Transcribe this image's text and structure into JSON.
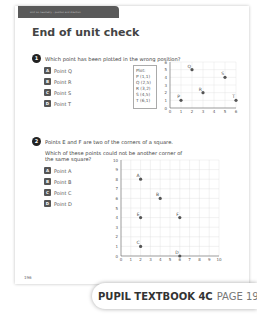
{
  "header": {
    "unit_label": "Unit 14: Geometry – position and direction",
    "title": "End of unit check"
  },
  "question1": {
    "number": "1",
    "text": "Which point has been plotted in the wrong position?",
    "options": [
      {
        "letter": "A",
        "label": "Point Q"
      },
      {
        "letter": "B",
        "label": "Point R"
      },
      {
        "letter": "C",
        "label": "Point S"
      },
      {
        "letter": "D",
        "label": "Point T"
      }
    ],
    "plot_box": {
      "title": "Plot:",
      "entries": [
        "P (1,1)",
        "Q (2,5)",
        "R (3,2)",
        "S (4,5)",
        "T (6,1)"
      ]
    }
  },
  "question2": {
    "number": "2",
    "text_line1": "Points E and F are two of the corners of a square.",
    "text_line2": "Which of these points could not be another corner of",
    "text_line3": "the same square?",
    "options": [
      {
        "letter": "A",
        "label": "Point A"
      },
      {
        "letter": "B",
        "label": "Point B"
      },
      {
        "letter": "C",
        "label": "Point C"
      },
      {
        "letter": "D",
        "label": "Point D"
      }
    ]
  },
  "footer": {
    "page_number": "196",
    "book_label": "PUPIL TEXTBOOK 4C",
    "page_label": "PAGE 196"
  },
  "chart_data": [
    {
      "type": "scatter",
      "title": "",
      "xlabel": "",
      "ylabel": "",
      "xlim": [
        0,
        6
      ],
      "ylim": [
        0,
        6
      ],
      "x_ticks": [
        0,
        1,
        2,
        3,
        4,
        5,
        6
      ],
      "y_ticks": [
        0,
        1,
        2,
        3,
        4,
        5,
        6
      ],
      "grid": true,
      "points": [
        {
          "label": "P",
          "x": 1,
          "y": 1
        },
        {
          "label": "Q",
          "x": 2,
          "y": 5
        },
        {
          "label": "R",
          "x": 3,
          "y": 2
        },
        {
          "label": "S",
          "x": 5,
          "y": 4
        },
        {
          "label": "T",
          "x": 6,
          "y": 1
        }
      ]
    },
    {
      "type": "scatter",
      "title": "",
      "xlabel": "",
      "ylabel": "",
      "xlim": [
        0,
        10
      ],
      "ylim": [
        0,
        10
      ],
      "x_ticks": [
        0,
        1,
        2,
        3,
        4,
        5,
        6,
        7,
        8,
        9,
        10
      ],
      "y_ticks": [
        0,
        1,
        2,
        3,
        4,
        5,
        6,
        7,
        8,
        9,
        10
      ],
      "grid": true,
      "points": [
        {
          "label": "A",
          "x": 2,
          "y": 8
        },
        {
          "label": "B",
          "x": 4,
          "y": 6
        },
        {
          "label": "E",
          "x": 2,
          "y": 4
        },
        {
          "label": "F",
          "x": 6,
          "y": 4
        },
        {
          "label": "C",
          "x": 2,
          "y": 1
        },
        {
          "label": "D",
          "x": 6,
          "y": 0
        }
      ]
    }
  ]
}
